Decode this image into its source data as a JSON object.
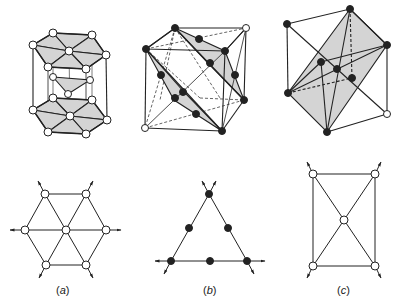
{
  "figure": {
    "panels": [
      {
        "id": "a",
        "label": "(a)",
        "label_letter": "a",
        "top_structure": "hexagonal-close-packed-unit",
        "bottom_structure": "hexagonal-layer-projection",
        "atom_style": "open"
      },
      {
        "id": "b",
        "label": "(b)",
        "label_letter": "b",
        "top_structure": "cubic-cell-with-shaded-diagonal-planes",
        "bottom_structure": "triangular-layer-projection",
        "atom_style": "filled"
      },
      {
        "id": "c",
        "label": "(c)",
        "label_letter": "c",
        "top_structure": "cubic-cell-with-shaded-rectangular-plane",
        "bottom_structure": "rectangular-layer-projection",
        "atom_style": "open"
      }
    ],
    "colors": {
      "line": "#222222",
      "shade": "#d4d4d4",
      "open_atom": "#ffffff",
      "filled_atom": "#222222",
      "background": "#ffffff"
    }
  }
}
